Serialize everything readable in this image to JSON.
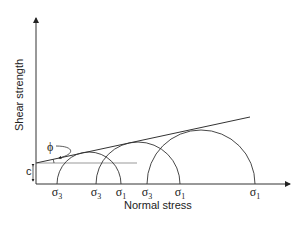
{
  "diagram": {
    "axes": {
      "y_label": "Shear strength",
      "x_label": "Normal stress"
    },
    "labels": {
      "cohesion": "c",
      "friction_angle": "ϕ"
    },
    "circles": [
      {
        "sigma3_label": "σ",
        "sigma3_sub": "3",
        "sigma1_label": "σ",
        "sigma1_sub": "1"
      },
      {
        "sigma3_label": "σ",
        "sigma3_sub": "3",
        "sigma1_label": "σ",
        "sigma1_sub": "1"
      },
      {
        "sigma3_label": "σ",
        "sigma3_sub": "3",
        "sigma1_label": "σ",
        "sigma1_sub": "1"
      }
    ],
    "colors": {
      "line": "#333333",
      "reference_line": "#999999"
    }
  }
}
